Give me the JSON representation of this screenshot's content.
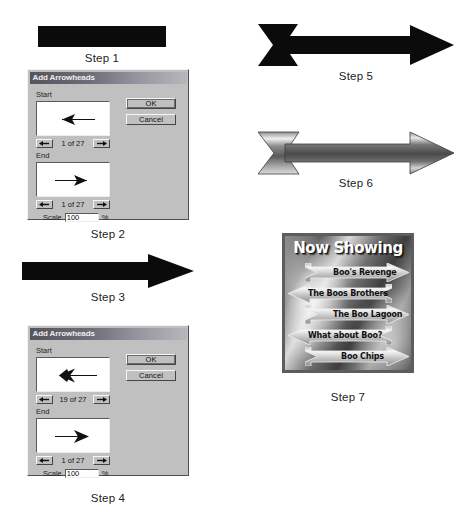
{
  "steps": [
    {
      "id": "step1",
      "label": "Step 1"
    },
    {
      "id": "step2",
      "label": "Step 2"
    },
    {
      "id": "step3",
      "label": "Step 3"
    },
    {
      "id": "step4",
      "label": "Step 4"
    },
    {
      "id": "step5",
      "label": "Step 5"
    },
    {
      "id": "step6",
      "label": "Step 6"
    },
    {
      "id": "step7",
      "label": "Step 7"
    }
  ],
  "dialog_top": {
    "title": "Add Arrowheads",
    "start_group_label": "Start",
    "end_group_label": "End",
    "start_counter": "1 of 27",
    "end_counter": "1 of 27",
    "start_preview_icon": "thin-left-arrow-icon",
    "end_preview_icon": "thin-right-arrow-icon",
    "prev_icon": "left-arrow-icon",
    "next_icon": "right-arrow-icon",
    "scale_label": "Scale",
    "scale_value": "100",
    "scale_unit": "%",
    "ok_label": "OK",
    "cancel_label": "Cancel"
  },
  "dialog_bottom": {
    "title": "Add Arrowheads",
    "start_group_label": "Start",
    "end_group_label": "End",
    "start_counter": "19 of 27",
    "end_counter": "1 of 27",
    "start_preview_icon": "feathered-left-arrow-icon",
    "end_preview_icon": "solid-right-arrowhead-icon",
    "prev_icon": "left-arrow-icon",
    "next_icon": "right-arrow-icon",
    "scale_label": "Scale",
    "scale_value": "100",
    "scale_unit": "%",
    "ok_label": "OK",
    "cancel_label": "Cancel"
  },
  "shapes": {
    "step1_bar": "plain-black-rectangle",
    "step3_arrow": "black-single-headed-arrow",
    "step5_arrow": "black-feathered-double-arrow",
    "step6_arrow": "metallic-gradient-feathered-arrow"
  },
  "poster": {
    "heading": "Now Showing",
    "movies": [
      {
        "title": "Boo's Revenge",
        "direction": "right"
      },
      {
        "title": "The Boos Brothers",
        "direction": "left"
      },
      {
        "title": "The Boo Lagoon",
        "direction": "right"
      },
      {
        "title": "What about Boo?",
        "direction": "left"
      },
      {
        "title": "Boo Chips",
        "direction": "right"
      }
    ]
  },
  "colors": {
    "black": "#0b0b0b",
    "dialog_face": "#c0c0c0",
    "titlebar_dark": "#54545c",
    "titlebar_light": "#b6b6bd",
    "poster_frame": "#5d5d5d",
    "text": "#1a1a1a"
  }
}
